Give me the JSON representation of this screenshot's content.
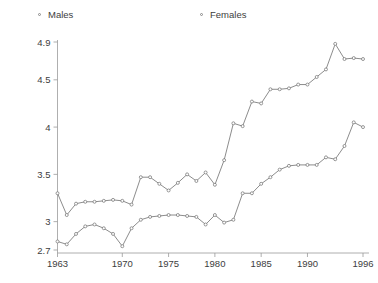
{
  "legend": {
    "position": "top",
    "entries": [
      {
        "label": "Males",
        "marker": "open-circle-marker"
      },
      {
        "label": "Females",
        "marker": "open-circle-marker"
      }
    ]
  },
  "axes": {
    "y_ticks": [
      "2.7",
      "3",
      "3.5",
      "4",
      "4.5",
      "4.9"
    ],
    "x_ticks": [
      "1963",
      "1970",
      "1975",
      "1980",
      "1985",
      "1990",
      "1996"
    ]
  },
  "colors": {
    "line": "#6e6e6e",
    "axis": "#9a9a9a",
    "text": "#3d3d3d",
    "background": "#ffffff"
  },
  "chart_data": {
    "type": "line",
    "title": "",
    "xlabel": "",
    "ylabel": "",
    "xlim": [
      1963,
      1996
    ],
    "ylim": [
      2.7,
      4.9
    ],
    "grid": false,
    "legend_position": "top",
    "x": [
      1963,
      1964,
      1965,
      1966,
      1967,
      1968,
      1969,
      1970,
      1971,
      1972,
      1973,
      1974,
      1975,
      1976,
      1977,
      1978,
      1979,
      1980,
      1981,
      1982,
      1983,
      1984,
      1985,
      1986,
      1987,
      1988,
      1989,
      1990,
      1991,
      1992,
      1993,
      1994,
      1995,
      1996
    ],
    "xtick_values": [
      1963,
      1970,
      1975,
      1980,
      1985,
      1990,
      1996
    ],
    "ytick_values": [
      2.7,
      3.0,
      3.5,
      4.0,
      4.5,
      4.9
    ],
    "series": [
      {
        "name": "Males",
        "marker": "open-circle-marker",
        "values": [
          2.79,
          2.76,
          2.87,
          2.95,
          2.97,
          2.93,
          2.87,
          2.74,
          2.93,
          3.02,
          3.05,
          3.06,
          3.07,
          3.07,
          3.06,
          3.05,
          2.97,
          3.07,
          2.99,
          3.02,
          3.3,
          3.3,
          3.4,
          3.47,
          3.55,
          3.59,
          3.6,
          3.6,
          3.6,
          3.68,
          3.66,
          3.8,
          4.05,
          4.0
        ]
      },
      {
        "name": "Females",
        "marker": "open-circle-marker",
        "values": [
          3.3,
          3.07,
          3.19,
          3.21,
          3.21,
          3.22,
          3.23,
          3.22,
          3.18,
          3.47,
          3.47,
          3.4,
          3.33,
          3.41,
          3.5,
          3.43,
          3.52,
          3.39,
          3.65,
          4.04,
          4.01,
          4.27,
          4.25,
          4.4,
          4.4,
          4.41,
          4.45,
          4.45,
          4.53,
          4.61,
          4.88,
          4.72,
          4.73,
          4.72
        ]
      }
    ]
  }
}
